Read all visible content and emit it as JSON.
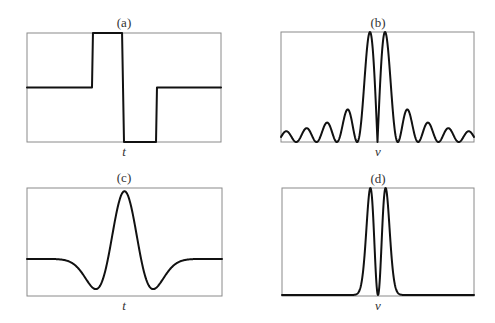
{
  "figure": {
    "panels": [
      {
        "id": "a",
        "title": "(a)",
        "xlabel": "t",
        "frame": {
          "x": 27,
          "y": 33,
          "w": 194,
          "h": 109
        }
      },
      {
        "id": "b",
        "title": "(b)",
        "xlabel": "ν",
        "frame": {
          "x": 281,
          "y": 32,
          "w": 193,
          "h": 110
        }
      },
      {
        "id": "c",
        "title": "(c)",
        "xlabel": "t",
        "frame": {
          "x": 27,
          "y": 188,
          "w": 195,
          "h": 108
        }
      },
      {
        "id": "d",
        "title": "(d)",
        "xlabel": "ν",
        "frame": {
          "x": 282,
          "y": 188,
          "w": 192,
          "h": 108
        }
      }
    ]
  },
  "chart_data": [
    {
      "type": "line",
      "title": "(a)",
      "xlabel": "t",
      "ylabel": "",
      "description": "Rectangular doublet pulse: positive square pulse followed immediately by negative square pulse",
      "x": [
        0.0,
        0.335,
        0.34,
        0.49,
        0.5,
        0.665,
        0.67,
        1.0
      ],
      "y": [
        0.0,
        0.0,
        1.0,
        1.0,
        -1.0,
        -1.0,
        0.0,
        0.0
      ],
      "xlim": [
        0,
        1
      ],
      "ylim": [
        -1,
        1
      ]
    },
    {
      "type": "line",
      "title": "(b)",
      "xlabel": "ν",
      "ylabel": "",
      "description": "Magnitude spectrum of (a): |sin^2|-type sinc spectrum with zero at center, two tall main lobes and decaying side lobes",
      "x_center": 0.5,
      "main_lobe_peak": 1.0,
      "side_lobe_peaks": [
        0.32,
        0.2,
        0.14,
        0.11,
        0.09,
        0.08,
        0.07,
        0.065
      ],
      "side_lobes_per_side": 8,
      "xlim": [
        0,
        1
      ],
      "ylim": [
        0,
        1
      ]
    },
    {
      "type": "line",
      "title": "(c)",
      "xlabel": "t",
      "ylabel": "",
      "description": "Smooth wavelet (Mexican-hat-like): central positive peak with two negative side lobes, flat baseline",
      "x": [
        0.0,
        0.15,
        0.25,
        0.33,
        0.4,
        0.45,
        0.5,
        0.55,
        0.6,
        0.67,
        0.75,
        0.85,
        1.0
      ],
      "y": [
        0.0,
        0.0,
        -0.12,
        -0.45,
        -0.1,
        0.75,
        1.0,
        0.75,
        -0.1,
        -0.45,
        -0.12,
        0.0,
        0.0
      ],
      "xlim": [
        0,
        1
      ],
      "ylim": [
        -0.5,
        1.0
      ]
    },
    {
      "type": "line",
      "title": "(d)",
      "xlabel": "ν",
      "ylabel": "",
      "description": "Magnitude spectrum of (c): two narrow peaks either side of zero at center, no side lobes",
      "x_center": 0.5,
      "peaks": [
        {
          "x": 0.48,
          "y": 1.0
        },
        {
          "x": 0.52,
          "y": 1.0
        }
      ],
      "xlim": [
        0,
        1
      ],
      "ylim": [
        0,
        1
      ]
    }
  ]
}
